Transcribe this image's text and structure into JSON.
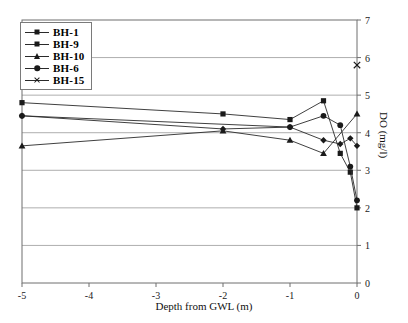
{
  "chart_data": {
    "type": "line",
    "title": "",
    "xlabel": "Depth from GWL (m)",
    "ylabel": "DO (mg/l)",
    "xlim": [
      -5,
      0
    ],
    "ylim": [
      0,
      7
    ],
    "xticks": [
      "-5",
      "-4",
      "-3",
      "-2",
      "-1",
      "0"
    ],
    "xtick_values": [
      -5,
      -4,
      -3,
      -2,
      -1,
      0
    ],
    "yticks": [
      "0",
      "1",
      "2",
      "3",
      "4",
      "5",
      "6",
      "7"
    ],
    "ytick_values": [
      0,
      1,
      2,
      3,
      4,
      5,
      6,
      7
    ],
    "grid": "horizontal",
    "y_axis_position": "right",
    "legend_position": "top-left",
    "series": [
      {
        "name": "BH-1",
        "marker": "diamond",
        "color": "#1a1a1a",
        "x": [
          -5,
          -2,
          -1,
          -0.5,
          -0.25,
          -0.1,
          0
        ],
        "y": [
          4.45,
          4.1,
          4.15,
          3.8,
          3.7,
          3.85,
          3.65
        ]
      },
      {
        "name": "BH-9",
        "marker": "square",
        "color": "#1a1a1a",
        "x": [
          -5,
          -2,
          -1,
          -0.5,
          -0.25,
          -0.1,
          0
        ],
        "y": [
          4.8,
          4.5,
          4.35,
          4.85,
          3.45,
          2.95,
          2.0
        ]
      },
      {
        "name": "BH-10",
        "marker": "triangle",
        "color": "#1a1a1a",
        "x": [
          -5,
          -2,
          -1,
          -0.5,
          0
        ],
        "y": [
          3.65,
          4.05,
          3.8,
          3.45,
          4.5
        ]
      },
      {
        "name": "BH-6",
        "marker": "circle",
        "color": "#1a1a1a",
        "x": [
          -5,
          -1,
          -0.5,
          -0.25,
          -0.1,
          0
        ],
        "y": [
          4.45,
          4.15,
          4.45,
          4.2,
          3.1,
          2.2
        ]
      },
      {
        "name": "BH-15",
        "marker": "cross",
        "color": "#1a1a1a",
        "x": [
          0
        ],
        "y": [
          5.8
        ]
      }
    ]
  },
  "legend": {
    "items": [
      {
        "label": "BH-1"
      },
      {
        "label": "BH-9"
      },
      {
        "label": "BH-10"
      },
      {
        "label": "BH-6"
      },
      {
        "label": "BH-15"
      }
    ]
  },
  "colors": {
    "plot_border": "#6f6f6f",
    "gridline": "#999999",
    "series_line": "#2a2a2a",
    "marker_fill": "#1a1a1a",
    "background": "#ffffff"
  }
}
